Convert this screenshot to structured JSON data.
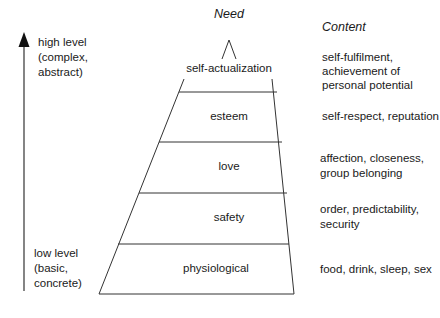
{
  "headers": {
    "need": "Need",
    "content": "Content"
  },
  "axis": {
    "top_label": [
      "high level",
      "(complex,",
      "abstract)"
    ],
    "bottom_label": [
      "low level",
      "(basic,",
      "concrete)"
    ],
    "direction": "up"
  },
  "levels": [
    {
      "need": "self-actualization",
      "content": [
        "self-fulfilment,",
        "achievement of",
        "personal potential"
      ]
    },
    {
      "need": "esteem",
      "content": [
        "self-respect, reputation"
      ]
    },
    {
      "need": "love",
      "content": [
        "affection, closeness,",
        "group belonging"
      ]
    },
    {
      "need": "safety",
      "content": [
        "order, predictability,",
        "security"
      ]
    },
    {
      "need": "physiological",
      "content": [
        "food, drink, sleep, sex"
      ]
    }
  ],
  "colors": {
    "line": "#333333",
    "text": "#1a1a1a",
    "background": "#ffffff"
  }
}
